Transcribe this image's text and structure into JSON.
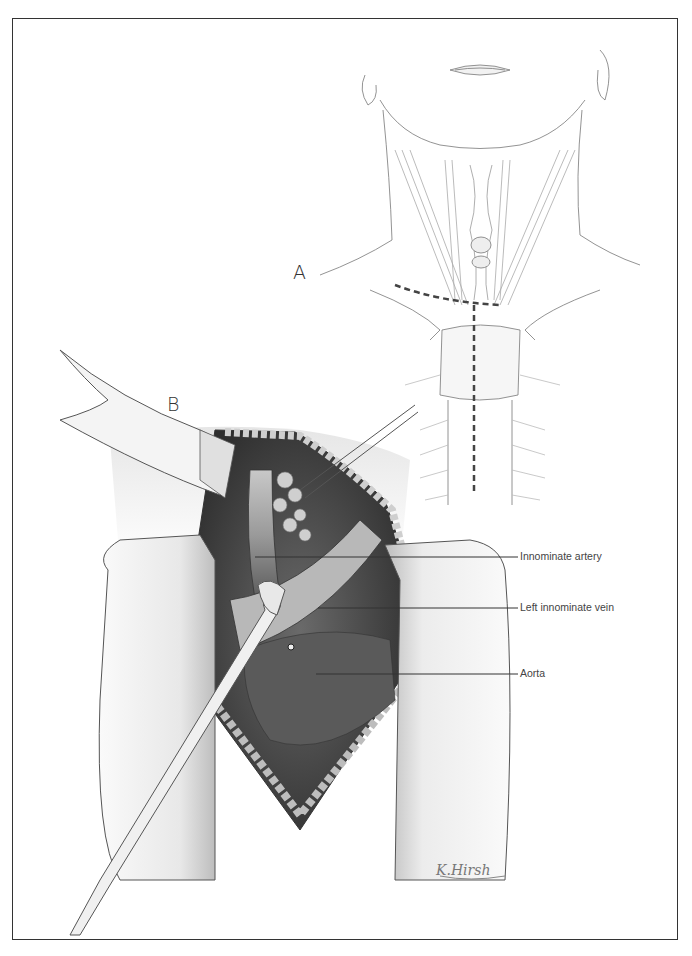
{
  "figure": {
    "panels": [
      {
        "id": "A",
        "label": "A",
        "description": "Neck and upper chest with dashed incision lines (collar incision and median sternotomy)"
      },
      {
        "id": "B",
        "label": "B",
        "description": "Operative field through sternotomy with retractors, showing great vessels"
      }
    ],
    "callouts": [
      {
        "label": "Innominate artery"
      },
      {
        "label": "Left innominate vein"
      },
      {
        "label": "Aorta"
      }
    ],
    "signature": "K.Hirsh",
    "colors": {
      "line": "#333333",
      "shade_dark": "#4a4a4a",
      "shade_mid": "#8a8a8a",
      "shade_light": "#d0d0d0",
      "incision_dash": "#444444"
    }
  }
}
